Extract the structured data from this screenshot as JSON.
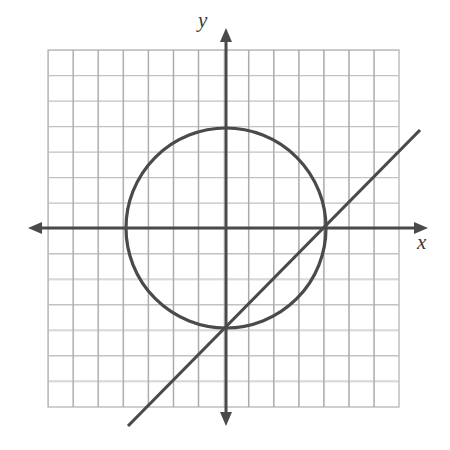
{
  "figure": {
    "kind": "coordinate-plane-graph",
    "width": 450,
    "height": 450,
    "background_color": "#ffffff"
  },
  "axes": {
    "x_label": "x",
    "y_label": "y",
    "label_style": "italic",
    "axis_color": "#4a4a4a",
    "x_axis_arrows": "both",
    "y_axis_arrows": "both",
    "origin_px": {
      "x": 226,
      "y": 228
    }
  },
  "grid": {
    "show": true,
    "color": "#b9b9b9",
    "minor_color": "#d8d8d8",
    "left_px": 48,
    "top_px": 50,
    "right_px": 399,
    "bottom_px": 407,
    "cell_px": 25.1,
    "columns": 14,
    "rows": 14
  },
  "chart_data": {
    "type": "scatter",
    "title": "",
    "xlabel": "x",
    "ylabel": "y",
    "grid": true,
    "legend": "none",
    "unit_px": 25.1,
    "xlim": [
      -7.1,
      6.9
    ],
    "ylim": [
      -7.0,
      7.0
    ],
    "series": [
      {
        "name": "circle",
        "type": "circle",
        "equation": "x^2 + y^2 = 16",
        "center": [
          0,
          0
        ],
        "radius": 4,
        "color": "#4a4a4a",
        "stroke_width_px": 3.2,
        "center_px": {
          "x": 226,
          "y": 228
        },
        "radius_px": 100
      },
      {
        "name": "line",
        "type": "line",
        "equation": "y = x - 4",
        "slope": 1,
        "y_intercept": -4,
        "x_intercept": 4,
        "color": "#4a4a4a",
        "stroke_width_px": 3.2,
        "endpoints_px": [
          {
            "x": 128,
            "y": 426
          },
          {
            "x": 420,
            "y": 130
          }
        ],
        "endpoints_units": [
          [
            -3.9,
            -7.9
          ],
          [
            7.7,
            3.8
          ]
        ]
      }
    ],
    "intersections": [
      {
        "x": 0,
        "y": -4,
        "px": {
          "x": 226,
          "y": 328
        }
      },
      {
        "x": 4,
        "y": 0,
        "px": {
          "x": 326,
          "y": 228
        }
      }
    ]
  }
}
